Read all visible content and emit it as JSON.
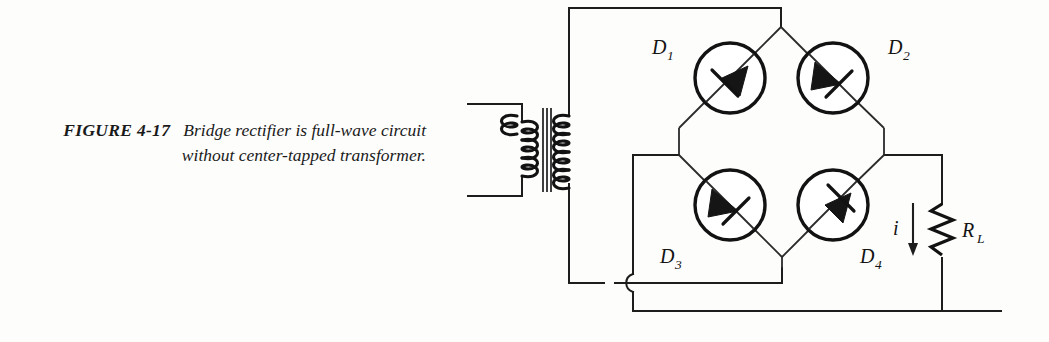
{
  "figure": {
    "label": "FIGURE 4-17",
    "caption": "Bridge rectifier is full-wave circuit without center-tapped transformer."
  },
  "circuit": {
    "title": "bridge-rectifier-schematic",
    "components": {
      "transformer": {
        "name": "transformer",
        "primary_turns": 3,
        "secondary_turns": 5,
        "center_tapped": "no"
      },
      "diodes": [
        {
          "id": "D1",
          "letter": "D",
          "subscript": "1",
          "position": "top-left",
          "direction": "down-left"
        },
        {
          "id": "D2",
          "letter": "D",
          "subscript": "2",
          "position": "top-right",
          "direction": "down-right"
        },
        {
          "id": "D3",
          "letter": "D",
          "subscript": "3",
          "position": "bottom-left",
          "direction": "down-right"
        },
        {
          "id": "D4",
          "letter": "D",
          "subscript": "4",
          "position": "bottom-right",
          "direction": "up-right"
        }
      ],
      "load": {
        "id": "RL",
        "letter": "R",
        "subscript": "L",
        "type": "resistor"
      },
      "current": {
        "label": "i",
        "direction": "down"
      }
    },
    "colors": {
      "ink": "#1d1d1d",
      "background": "#fdfdfc"
    }
  }
}
